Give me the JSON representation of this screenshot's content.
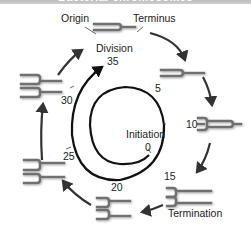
{
  "banner": {
    "title": "Bacterial chromosomes"
  },
  "labels": {
    "origin": "Origin",
    "terminus": "Terminus",
    "division": "Division",
    "initiation": "Initiation",
    "termination": "Termination"
  },
  "timeline": {
    "unit_ticks": [
      "0",
      "5",
      "10",
      "15",
      "20",
      "25",
      "30",
      "35"
    ]
  },
  "colors": {
    "chromosome": "#707070",
    "arrow": "#333333",
    "spiral": "#111111"
  }
}
